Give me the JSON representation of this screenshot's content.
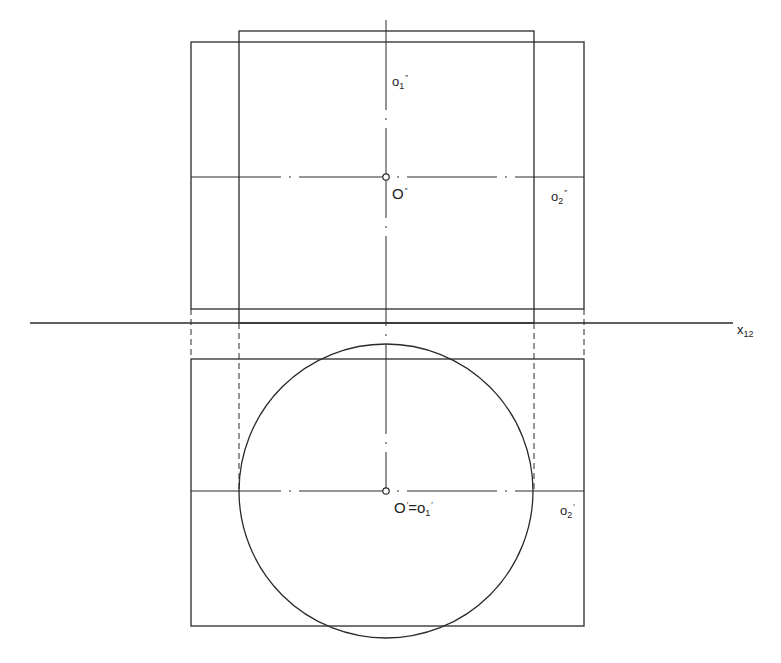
{
  "diagram": {
    "type": "orthographic-projection",
    "colors": {
      "line": "#2a2a2a",
      "background": "#ffffff"
    },
    "labels": {
      "o1_front": {
        "base": "o",
        "sub": "1",
        "prime": "″"
      },
      "O_front": {
        "base": "O",
        "prime": "″"
      },
      "o2_front": {
        "base": "o",
        "sub": "2",
        "prime": "″"
      },
      "axis": {
        "base": "x",
        "sub": "12"
      },
      "O_top_eq": {
        "base": "O",
        "prime": "′",
        "eq": "=",
        "base2": "o",
        "sub2": "1",
        "prime2": "′"
      },
      "o2_top": {
        "base": "o",
        "sub": "2",
        "prime": "′"
      }
    }
  }
}
